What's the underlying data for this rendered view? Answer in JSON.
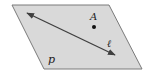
{
  "diagram": {
    "type": "plane-line-point",
    "plane": {
      "label": "p",
      "vertices": [
        [
          12,
          5
        ],
        [
          109,
          5
        ],
        [
          142,
          69
        ],
        [
          44,
          69
        ]
      ],
      "fill": "#d9d9d9",
      "stroke": "#7a7a7a"
    },
    "line": {
      "label": "ℓ",
      "from": [
        27,
        13
      ],
      "to": [
        115,
        55
      ],
      "double_arrow": true,
      "stroke": "#3f3f3f"
    },
    "point": {
      "label": "A",
      "position": [
        94,
        27
      ],
      "color": "#111111"
    }
  }
}
